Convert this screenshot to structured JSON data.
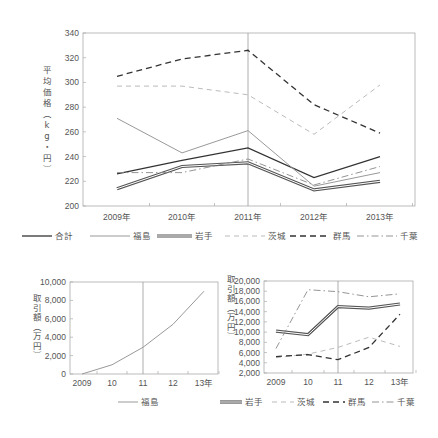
{
  "chart_data": [
    {
      "id": "top",
      "type": "line",
      "title": "",
      "xlabel": "",
      "ylabel": "平均価格（kg・円）",
      "categories": [
        "2009年",
        "2010年",
        "2011年",
        "2012年",
        "2013年"
      ],
      "ylim": [
        200,
        340
      ],
      "yticks": [
        200,
        220,
        240,
        260,
        280,
        300,
        320,
        340
      ],
      "vline_at": "2011年",
      "grid": false,
      "legend_position": "bottom",
      "series": [
        {
          "name": "合計",
          "style": "solid-black",
          "values": [
            226,
            237,
            247,
            223,
            240
          ]
        },
        {
          "name": "福島",
          "style": "solid-gray",
          "values": [
            271,
            243,
            261,
            216,
            227
          ]
        },
        {
          "name": "岩手",
          "style": "double",
          "values": [
            214,
            232,
            235,
            213,
            220
          ]
        },
        {
          "name": "茨城",
          "style": "dashed-lightgray",
          "values": [
            297,
            297,
            290,
            258,
            298
          ]
        },
        {
          "name": "群馬",
          "style": "dashed-black",
          "values": [
            305,
            319,
            326,
            282,
            259
          ]
        },
        {
          "name": "千葉",
          "style": "dashdot-gray",
          "values": [
            227,
            227,
            238,
            217,
            232
          ]
        }
      ]
    },
    {
      "id": "bottom-left",
      "type": "line",
      "title": "",
      "xlabel": "",
      "ylabel": "取引額（万円）",
      "categories": [
        "2009",
        "10",
        "11",
        "12",
        "13年"
      ],
      "ylim": [
        0,
        10000
      ],
      "yticks": [
        "0",
        "2,000",
        "4,000",
        "6,000",
        "8,000",
        "10,000"
      ],
      "vline_at": "11",
      "grid": false,
      "legend_position": "bottom",
      "series": [
        {
          "name": "福島",
          "style": "solid-gray",
          "values": [
            0,
            1000,
            2900,
            5400,
            9000
          ]
        }
      ]
    },
    {
      "id": "bottom-right",
      "type": "line",
      "title": "",
      "xlabel": "",
      "ylabel": "取引額（万円）",
      "categories": [
        "2009",
        "10",
        "11",
        "12",
        "13年"
      ],
      "ylim": [
        2000,
        20000
      ],
      "yticks": [
        "2,000",
        "4,000",
        "6,000",
        "8,000",
        "10,000",
        "12,000",
        "14,000",
        "16,000",
        "18,000",
        "20,000"
      ],
      "vline_at": "11",
      "grid": false,
      "legend_position": "bottom",
      "series": [
        {
          "name": "岩手",
          "style": "double",
          "values": [
            10200,
            9500,
            15000,
            14700,
            15500
          ]
        },
        {
          "name": "茨城",
          "style": "dashed-lightgray",
          "values": [
            5000,
            5700,
            7000,
            9000,
            7200
          ]
        },
        {
          "name": "群馬",
          "style": "dashed-black",
          "values": [
            5200,
            5600,
            4600,
            7000,
            13500
          ]
        },
        {
          "name": "千葉",
          "style": "dashdot-gray",
          "values": [
            6800,
            18300,
            17900,
            16900,
            17500
          ]
        }
      ]
    }
  ]
}
